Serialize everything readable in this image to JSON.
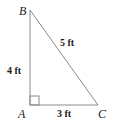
{
  "diagram": {
    "type": "right-triangle",
    "vertices": {
      "A": {
        "label": "A",
        "x": 30,
        "y": 105
      },
      "B": {
        "label": "B",
        "x": 30,
        "y": 10
      },
      "C": {
        "label": "C",
        "x": 98,
        "y": 105
      }
    },
    "sides": {
      "AB": {
        "label": "4 ft"
      },
      "BC": {
        "label": "5 ft"
      },
      "AC": {
        "label": "3 ft"
      }
    },
    "right_angle_at": "A",
    "colors": {
      "line": "#8a8a8a",
      "text": "#1a1a1a"
    }
  }
}
